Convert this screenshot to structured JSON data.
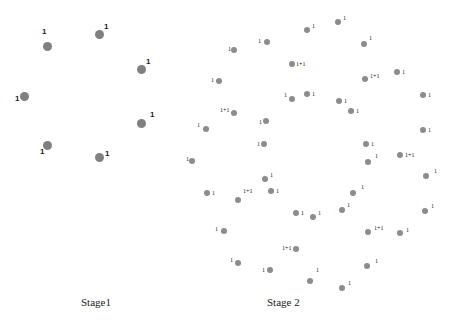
{
  "stages": [
    {
      "label": "Stage1",
      "label_pos": [
        99,
        296
      ],
      "node_size": "big",
      "nodes": [
        {
          "x": 47,
          "y": 46,
          "label": "1",
          "lx": 42,
          "ly": 32
        },
        {
          "x": 99,
          "y": 34,
          "label": "1",
          "lx": 104,
          "ly": 27
        },
        {
          "x": 141,
          "y": 69,
          "label": "1",
          "lx": 146,
          "ly": 62
        },
        {
          "x": 24,
          "y": 96,
          "label": "1",
          "lx": 15,
          "ly": 99
        },
        {
          "x": 141,
          "y": 123,
          "label": "1",
          "lx": 150,
          "ly": 115
        },
        {
          "x": 47,
          "y": 145,
          "label": "1",
          "lx": 40,
          "ly": 152
        },
        {
          "x": 99,
          "y": 157,
          "label": "1",
          "lx": 105,
          "ly": 154
        }
      ]
    },
    {
      "label": "Stage 2",
      "label_pos": [
        287,
        296
      ],
      "node_size": "small",
      "nodes": [
        {
          "x": 307,
          "y": 30,
          "label": "1",
          "lx": 312,
          "ly": 26
        },
        {
          "x": 338,
          "y": 22,
          "label": "1",
          "lx": 343,
          "ly": 18
        },
        {
          "x": 267,
          "y": 42,
          "label": "1",
          "lx": 258,
          "ly": 41
        },
        {
          "x": 234,
          "y": 50,
          "label": "1",
          "lx": 228,
          "ly": 49
        },
        {
          "x": 364,
          "y": 44,
          "label": "1",
          "lx": 369,
          "ly": 38
        },
        {
          "x": 292,
          "y": 64,
          "label": "1+1",
          "lx": 296,
          "ly": 64
        },
        {
          "x": 219,
          "y": 81,
          "label": "1",
          "lx": 211,
          "ly": 80
        },
        {
          "x": 365,
          "y": 79,
          "label": "1+1",
          "lx": 370,
          "ly": 76
        },
        {
          "x": 397,
          "y": 72,
          "label": "1",
          "lx": 402,
          "ly": 72
        },
        {
          "x": 423,
          "y": 95,
          "label": "1",
          "lx": 428,
          "ly": 95
        },
        {
          "x": 292,
          "y": 99,
          "label": "1",
          "lx": 284,
          "ly": 95
        },
        {
          "x": 307,
          "y": 94,
          "label": "1",
          "lx": 312,
          "ly": 94
        },
        {
          "x": 339,
          "y": 101,
          "label": "1",
          "lx": 344,
          "ly": 101
        },
        {
          "x": 351,
          "y": 111,
          "label": "1",
          "lx": 356,
          "ly": 111
        },
        {
          "x": 234,
          "y": 113,
          "label": "1+1",
          "lx": 220,
          "ly": 110
        },
        {
          "x": 206,
          "y": 129,
          "label": "1",
          "lx": 197,
          "ly": 125
        },
        {
          "x": 266,
          "y": 121,
          "label": "1",
          "lx": 259,
          "ly": 122
        },
        {
          "x": 423,
          "y": 130,
          "label": "1",
          "lx": 428,
          "ly": 130
        },
        {
          "x": 264,
          "y": 144,
          "label": "1",
          "lx": 257,
          "ly": 144
        },
        {
          "x": 366,
          "y": 144,
          "label": "1",
          "lx": 371,
          "ly": 144
        },
        {
          "x": 192,
          "y": 161,
          "label": "1",
          "lx": 186,
          "ly": 159
        },
        {
          "x": 368,
          "y": 162,
          "label": "1",
          "lx": 375,
          "ly": 156
        },
        {
          "x": 400,
          "y": 155,
          "label": "1+1",
          "lx": 405,
          "ly": 155
        },
        {
          "x": 265,
          "y": 179,
          "label": "1",
          "lx": 270,
          "ly": 175
        },
        {
          "x": 426,
          "y": 176,
          "label": "1",
          "lx": 434,
          "ly": 171
        },
        {
          "x": 207,
          "y": 193,
          "label": "1",
          "lx": 212,
          "ly": 193
        },
        {
          "x": 271,
          "y": 191,
          "label": "1",
          "lx": 276,
          "ly": 191
        },
        {
          "x": 238,
          "y": 200,
          "label": "1+1",
          "lx": 243,
          "ly": 191
        },
        {
          "x": 353,
          "y": 193,
          "label": "1",
          "lx": 361,
          "ly": 187
        },
        {
          "x": 296,
          "y": 213,
          "label": "1",
          "lx": 301,
          "ly": 213
        },
        {
          "x": 313,
          "y": 217,
          "label": "1",
          "lx": 318,
          "ly": 213
        },
        {
          "x": 342,
          "y": 210,
          "label": "1",
          "lx": 347,
          "ly": 205
        },
        {
          "x": 425,
          "y": 211,
          "label": "1",
          "lx": 431,
          "ly": 206
        },
        {
          "x": 224,
          "y": 231,
          "label": "1",
          "lx": 215,
          "ly": 229
        },
        {
          "x": 368,
          "y": 232,
          "label": "1+1",
          "lx": 374,
          "ly": 228
        },
        {
          "x": 400,
          "y": 233,
          "label": "1",
          "lx": 406,
          "ly": 230
        },
        {
          "x": 296,
          "y": 249,
          "label": "1+1",
          "lx": 282,
          "ly": 248
        },
        {
          "x": 238,
          "y": 263,
          "label": "1",
          "lx": 230,
          "ly": 260
        },
        {
          "x": 270,
          "y": 270,
          "label": "1",
          "lx": 262,
          "ly": 270
        },
        {
          "x": 367,
          "y": 266,
          "label": "1",
          "lx": 375,
          "ly": 261
        },
        {
          "x": 310,
          "y": 281,
          "label": "1",
          "lx": 316,
          "ly": 270
        },
        {
          "x": 342,
          "y": 288,
          "label": "1",
          "lx": 348,
          "ly": 283
        }
      ]
    }
  ],
  "colors": {
    "node_fill": "#8a8a8a",
    "label_text": "#222222",
    "background": "#ffffff"
  }
}
